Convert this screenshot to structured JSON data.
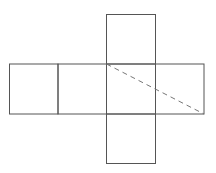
{
  "diagram": {
    "type": "cube-net",
    "stroke_color": "#555555",
    "dashed_color": "#777777",
    "background": "#ffffff",
    "faces": [
      {
        "name": "top",
        "x": 106.5,
        "y": 14.5,
        "w": 49,
        "h": 49.5
      },
      {
        "name": "left",
        "x": 9.5,
        "y": 64,
        "w": 48.5,
        "h": 50
      },
      {
        "name": "center-left",
        "x": 58,
        "y": 64,
        "w": 48.5,
        "h": 50
      },
      {
        "name": "center",
        "x": 106.5,
        "y": 64,
        "w": 49,
        "h": 50
      },
      {
        "name": "right",
        "x": 155.5,
        "y": 64,
        "w": 48.5,
        "h": 50
      },
      {
        "name": "bottom",
        "x": 106.5,
        "y": 114,
        "w": 49,
        "h": 49.5
      }
    ],
    "dashed_line": {
      "x1": 106.5,
      "y1": 64,
      "x2": 204,
      "y2": 114
    }
  }
}
